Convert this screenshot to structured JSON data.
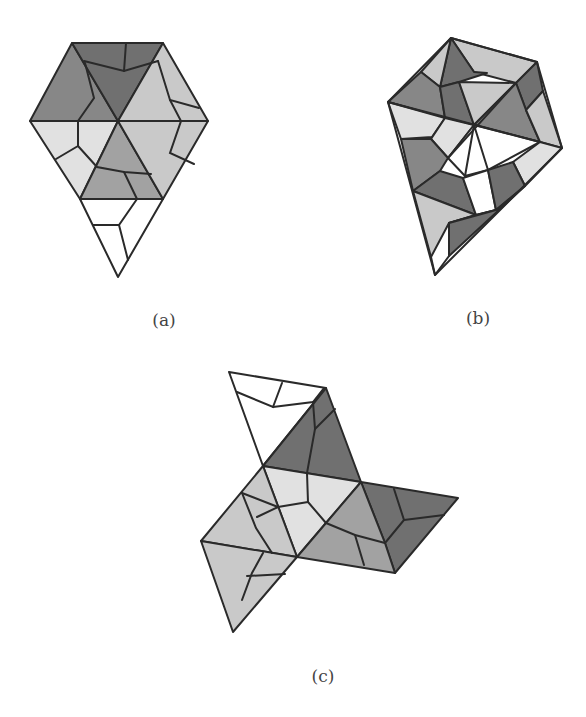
{
  "figure": {
    "panels": [
      {
        "id": "a",
        "caption": "(a)",
        "description": "Hexagonal-top kite polyhedron net with shaded faces"
      },
      {
        "id": "b",
        "caption": "(b)",
        "description": "Rotated kite polyhedron with shaded faces"
      },
      {
        "id": "c",
        "caption": "(c)",
        "description": "Three-armed unfolded net with shaded faces"
      }
    ],
    "shades": {
      "darkest": "#707070",
      "dark": "#878787",
      "medium": "#a2a2a2",
      "light": "#c9c9c9",
      "lighter": "#e1e1e1",
      "white": "#ffffff",
      "stroke": "#2a2a2a"
    }
  }
}
